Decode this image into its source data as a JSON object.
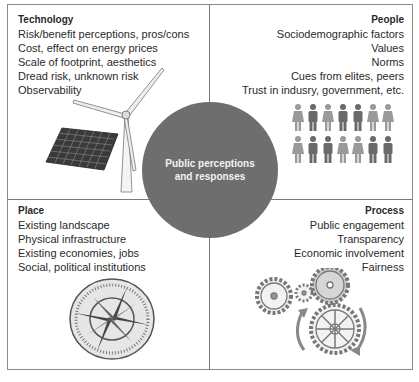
{
  "diagram": {
    "center": {
      "line1": "Public perceptions",
      "line2": "and responses",
      "color": "#6e6e6e"
    },
    "quadrants": {
      "technology": {
        "title": "Technology",
        "items": [
          "Risk/benefit perceptions, pros/cons",
          "Cost, effect on energy prices",
          "Scale of footprint, aesthetics",
          "Dread risk, unknown risk",
          "Observability"
        ],
        "illustration": [
          "wind-turbine-icon",
          "solar-panel-icon"
        ]
      },
      "people": {
        "title": "People",
        "items": [
          "Sociodemographic factors",
          "Values",
          "Norms",
          "Cues from elites, peers",
          "Trust in indusry, government, etc."
        ],
        "illustration": [
          "people-group-icon"
        ]
      },
      "place": {
        "title": "Place",
        "items": [
          "Existing landscape",
          "Physical infrastructure",
          "Existing economies, jobs",
          "Social, political institutions"
        ],
        "illustration": [
          "compass-rose-icon"
        ]
      },
      "process": {
        "title": "Process",
        "items": [
          "Public engagement",
          "Transparency",
          "Economic involvement",
          "Fairness"
        ],
        "illustration": [
          "gears-icon"
        ]
      }
    }
  }
}
